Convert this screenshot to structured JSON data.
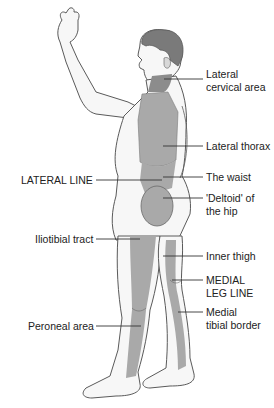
{
  "diagram": {
    "colors": {
      "skin": "#f7f7f7",
      "outline": "#5a5a5a",
      "region": "#a9a9a9",
      "region_dark": "#8c8c8c",
      "hair": "#7a7a7a",
      "leader_line": "#333333",
      "text": "#222222"
    },
    "labels": {
      "lateral_cervical_1": "Lateral",
      "lateral_cervical_2": "cervical area",
      "lateral_thorax": "Lateral thorax",
      "waist": "The waist",
      "deltoid_1": "'Deltoid' of",
      "deltoid_2": "the hip",
      "inner_thigh": "Inner thigh",
      "medial_leg_1": "MEDIAL",
      "medial_leg_2": "LEG LINE",
      "medial_tibial_1": "Medial",
      "medial_tibial_2": "tibial border",
      "lateral_line": "LATERAL LINE",
      "iliotibial": "Iliotibial tract",
      "peroneal": "Peroneal area"
    }
  }
}
